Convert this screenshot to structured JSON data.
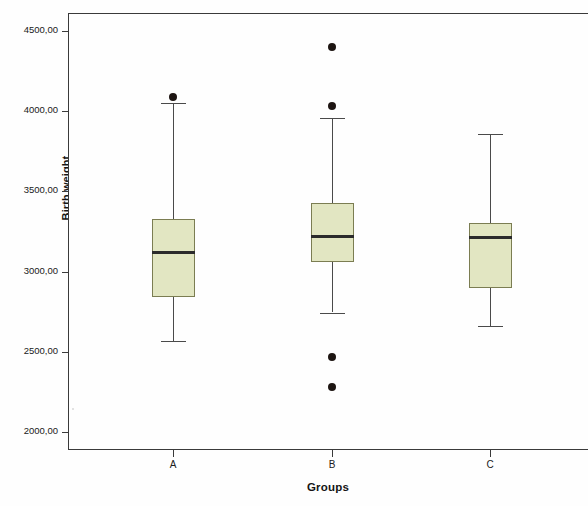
{
  "chart_data": {
    "type": "box",
    "title": "",
    "xlabel": "Groups",
    "ylabel": "Birth weight",
    "categories": [
      "A",
      "B",
      "C"
    ],
    "ylim": [
      1900,
      4620
    ],
    "yticks": [
      2000,
      2500,
      3000,
      3500,
      4000,
      4500
    ],
    "ytick_labels": [
      "2000,00",
      "2500,00",
      "3000,00",
      "3500,00",
      "4000,00",
      "4500,00"
    ],
    "grid": false,
    "legend": "none",
    "decimal_separator": ",",
    "box_fill_color": "#e2e6c2",
    "box_border_color": "#7b7d52",
    "median_color": "#2b2b2b",
    "outlier_color": "#1d1512",
    "axis_color": "#3a3a3a",
    "boxes": [
      {
        "category": "A",
        "whisker_low": 2570,
        "q1": 2840,
        "median": 3120,
        "q3": 3330,
        "whisker_high": 4050,
        "outliers": [
          4090
        ]
      },
      {
        "category": "B",
        "whisker_low": 2745,
        "q1": 3060,
        "median": 3220,
        "q3": 3430,
        "whisker_high": 3960,
        "outliers": [
          4400,
          4030,
          2470,
          2280
        ]
      },
      {
        "category": "C",
        "whisker_low": 2660,
        "q1": 2900,
        "median": 3210,
        "q3": 3300,
        "whisker_high": 3860,
        "outliers": []
      }
    ]
  },
  "axis": {
    "y_title": "Birth weight",
    "x_title": "Groups"
  }
}
